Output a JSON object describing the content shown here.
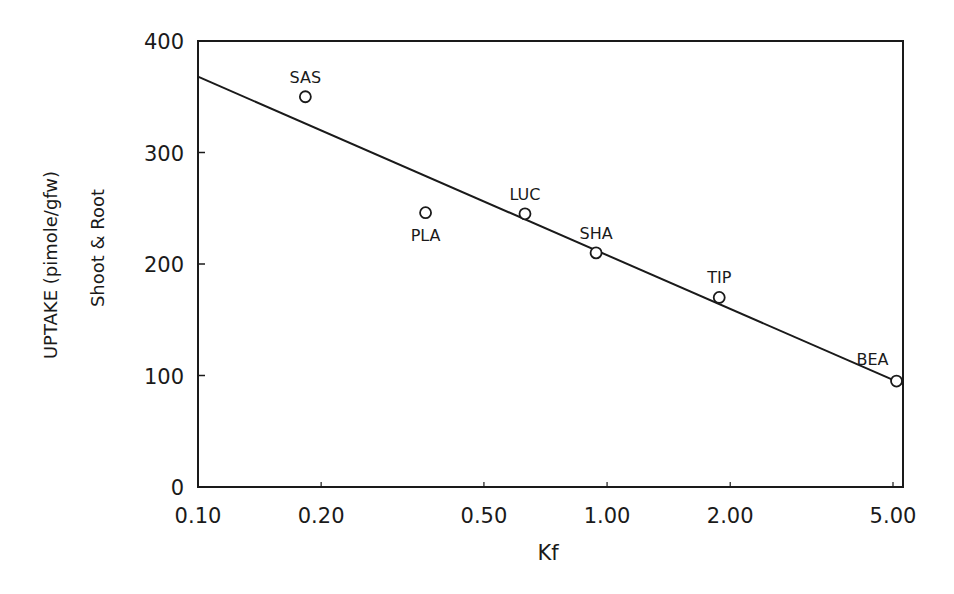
{
  "chart_data": {
    "type": "scatter",
    "title": "",
    "xlabel": "Kf",
    "ylabel": "UPTAKE (pimole/gfw)",
    "ylabel2": "Shoot & Root",
    "xscale": "log",
    "xlim": [
      0.1,
      5.3
    ],
    "ylim": [
      0,
      400
    ],
    "x_ticks": [
      0.1,
      0.2,
      0.5,
      1.0,
      2.0,
      5.0
    ],
    "x_tick_labels": [
      "0.10",
      "0.20",
      "0.50",
      "1.00",
      "2.00",
      "5.00"
    ],
    "y_ticks": [
      0,
      100,
      200,
      300,
      400
    ],
    "y_tick_labels": [
      "0",
      "100",
      "200",
      "300",
      "400"
    ],
    "grid": false,
    "legend": null,
    "marker": "open-circle",
    "points": [
      {
        "label": "SAS",
        "x": 0.183,
        "y": 350,
        "label_pos": "above"
      },
      {
        "label": "PLA",
        "x": 0.36,
        "y": 246,
        "label_pos": "below"
      },
      {
        "label": "LUC",
        "x": 0.63,
        "y": 245,
        "label_pos": "above"
      },
      {
        "label": "SHA",
        "x": 0.94,
        "y": 210,
        "label_pos": "above"
      },
      {
        "label": "TIP",
        "x": 1.88,
        "y": 170,
        "label_pos": "above"
      },
      {
        "label": "BEA",
        "x": 5.1,
        "y": 95,
        "label_pos": "above-left"
      }
    ],
    "regression_line": {
      "x": [
        0.1,
        5.3
      ],
      "y": [
        368,
        92
      ]
    }
  },
  "colors": {
    "ink": "#1a1a1a",
    "background": "#ffffff"
  }
}
